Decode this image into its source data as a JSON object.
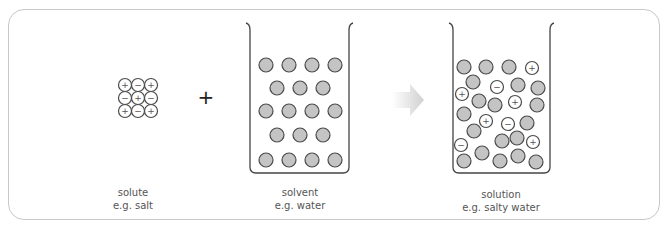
{
  "diagram": {
    "operator": "+",
    "colors": {
      "frame": "#c8c8c8",
      "particle_fill": "#c4c4c4",
      "particle_stroke": "#4a4a4a",
      "ion_fill": "#ffffff",
      "arrow": "#d6d6d6",
      "text": "#555555"
    },
    "solute": {
      "label": "solute",
      "example": "e.g. salt",
      "grid": [
        [
          "+",
          "−",
          "+"
        ],
        [
          "−",
          "+",
          "−"
        ],
        [
          "+",
          "−",
          "+"
        ]
      ]
    },
    "solvent": {
      "label": "solvent",
      "example": "e.g. water",
      "particle_count": 18
    },
    "solution": {
      "label": "solution",
      "example": "e.g. salty water",
      "ions": [
        {
          "x": 532,
          "y": 68,
          "sign": "+"
        },
        {
          "x": 497,
          "y": 87,
          "sign": "−"
        },
        {
          "x": 462,
          "y": 94,
          "sign": "+"
        },
        {
          "x": 515,
          "y": 102,
          "sign": "+"
        },
        {
          "x": 486,
          "y": 121,
          "sign": "+"
        },
        {
          "x": 508,
          "y": 124,
          "sign": "−"
        },
        {
          "x": 461,
          "y": 145,
          "sign": "−"
        },
        {
          "x": 533,
          "y": 142,
          "sign": "+"
        }
      ],
      "water": [
        {
          "x": 464,
          "y": 67
        },
        {
          "x": 486,
          "y": 67
        },
        {
          "x": 509,
          "y": 67
        },
        {
          "x": 473,
          "y": 82
        },
        {
          "x": 518,
          "y": 85
        },
        {
          "x": 538,
          "y": 88
        },
        {
          "x": 479,
          "y": 101
        },
        {
          "x": 495,
          "y": 105
        },
        {
          "x": 537,
          "y": 105
        },
        {
          "x": 464,
          "y": 114
        },
        {
          "x": 527,
          "y": 123
        },
        {
          "x": 474,
          "y": 131
        },
        {
          "x": 502,
          "y": 141
        },
        {
          "x": 517,
          "y": 138
        },
        {
          "x": 482,
          "y": 153
        },
        {
          "x": 464,
          "y": 161
        },
        {
          "x": 500,
          "y": 161
        },
        {
          "x": 518,
          "y": 156
        },
        {
          "x": 536,
          "y": 162
        }
      ]
    }
  }
}
